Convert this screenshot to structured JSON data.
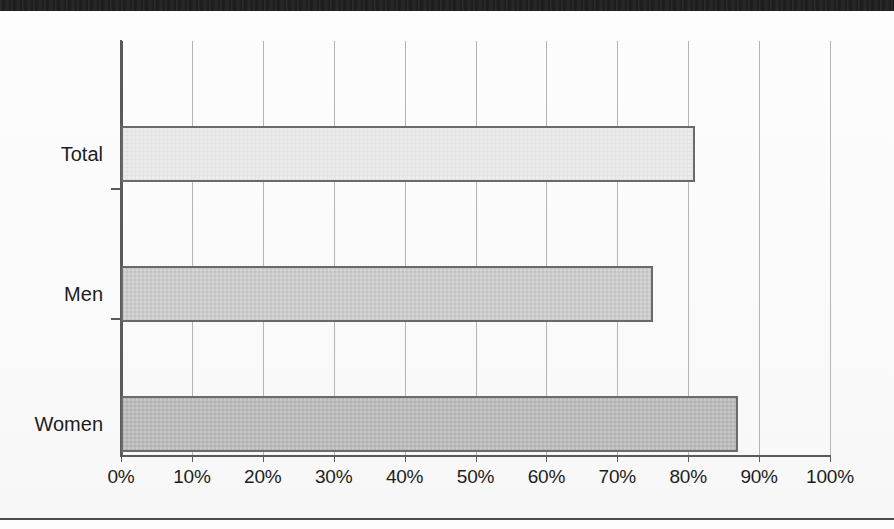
{
  "chart_data": {
    "type": "bar",
    "orientation": "horizontal",
    "title": "",
    "subtitle": "",
    "xlabel": "",
    "ylabel": "",
    "categories": [
      "Total",
      "Men",
      "Women"
    ],
    "values": [
      81,
      75,
      87
    ],
    "value_unit": "%",
    "xlim": [
      0,
      100
    ],
    "xticks": [
      0,
      10,
      20,
      30,
      40,
      50,
      60,
      70,
      80,
      90,
      100
    ],
    "xtick_labels": [
      "0%",
      "10%",
      "20%",
      "30%",
      "40%",
      "50%",
      "60%",
      "70%",
      "80%",
      "90%",
      "100%"
    ],
    "grid": "vertical",
    "legend": "none",
    "series": [
      {
        "name": "share",
        "values": [
          81,
          75,
          87
        ],
        "bar_tones": [
          "light",
          "mid",
          "dark"
        ],
        "bar_colors": [
          "#eaeaea",
          "#d7d7d7",
          "#c7c7c7"
        ]
      }
    ],
    "annotations": [],
    "colors": {
      "bar_outline": "#6a6a6a",
      "axis": "#5a5a5a",
      "gridline": "#b4b4b4",
      "text": "#1d1d1d",
      "background": "#fdfdfd",
      "scan_band": "#1b1b1b"
    }
  },
  "bars": [
    {
      "label": "Total",
      "value": 81,
      "tone": "light"
    },
    {
      "label": "Men",
      "value": 75,
      "tone": "mid"
    },
    {
      "label": "Women",
      "value": 87,
      "tone": "dark"
    }
  ],
  "axis": {
    "ticks": [
      {
        "label": "0%",
        "value": 0
      },
      {
        "label": "10%",
        "value": 10
      },
      {
        "label": "20%",
        "value": 20
      },
      {
        "label": "30%",
        "value": 30
      },
      {
        "label": "40%",
        "value": 40
      },
      {
        "label": "50%",
        "value": 50
      },
      {
        "label": "60%",
        "value": 60
      },
      {
        "label": "70%",
        "value": 70
      },
      {
        "label": "80%",
        "value": 80
      },
      {
        "label": "90%",
        "value": 90
      },
      {
        "label": "100%",
        "value": 100
      }
    ]
  }
}
